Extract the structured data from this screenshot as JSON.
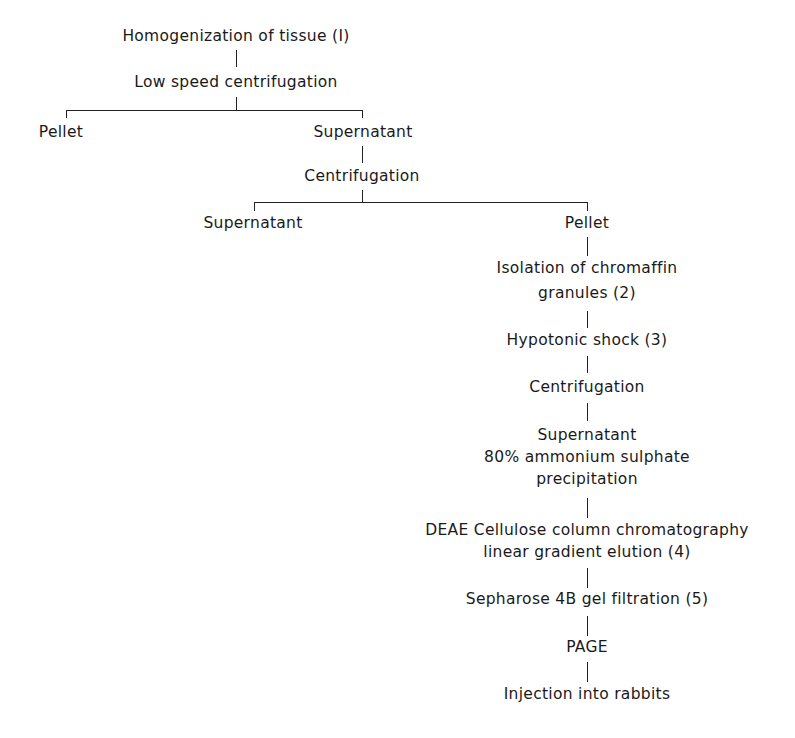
{
  "diagram": {
    "type": "flowchart",
    "nodes": {
      "homogenization": "Homogenization of tissue (I)",
      "low_speed": "Low speed centrifugation",
      "pellet1": "Pellet",
      "supernatant1": "Supernatant",
      "centrifugation1": "Centrifugation",
      "supernatant2": "Supernatant",
      "pellet2": "Pellet",
      "isolation_line1": "Isolation of chromaffin",
      "isolation_line2": "granules (2)",
      "hypotonic": "Hypotonic shock (3)",
      "centrifugation2": "Centrifugation",
      "supernatant3": "Supernatant",
      "ammonium_line1": "80% ammonium sulphate",
      "ammonium_line2": "precipitation",
      "deae_line1": "DEAE Cellulose column chromatography",
      "deae_line2": "linear gradient elution (4)",
      "sepharose": "Sepharose 4B gel filtration (5)",
      "page": "PAGE",
      "injection": "Injection into rabbits"
    },
    "edges": [
      [
        "homogenization",
        "low_speed"
      ],
      [
        "low_speed",
        "pellet1"
      ],
      [
        "low_speed",
        "supernatant1"
      ],
      [
        "supernatant1",
        "centrifugation1"
      ],
      [
        "centrifugation1",
        "supernatant2"
      ],
      [
        "centrifugation1",
        "pellet2"
      ],
      [
        "pellet2",
        "isolation"
      ],
      [
        "isolation",
        "hypotonic"
      ],
      [
        "hypotonic",
        "centrifugation2"
      ],
      [
        "centrifugation2",
        "supernatant3"
      ],
      [
        "supernatant3",
        "deae"
      ],
      [
        "deae",
        "sepharose"
      ],
      [
        "sepharose",
        "page"
      ],
      [
        "page",
        "injection"
      ]
    ]
  }
}
